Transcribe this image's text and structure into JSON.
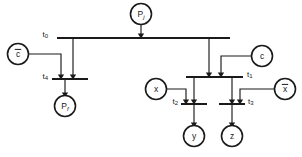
{
  "diagram": {
    "type": "petri-net",
    "title": "",
    "canvas": {
      "width": 302,
      "height": 157
    },
    "colors": {
      "ink": "#1a1a1a",
      "background": "#ffffff"
    },
    "places": [
      {
        "id": "Pj",
        "base": "P",
        "sub": "j",
        "overbar": false,
        "cx": 141,
        "cy": 14,
        "r": 10.5,
        "name": "place-pj"
      },
      {
        "id": "cbar",
        "base": "c",
        "sub": "",
        "overbar": true,
        "cx": 18,
        "cy": 54,
        "r": 10.5,
        "name": "place-c-bar"
      },
      {
        "id": "Pf",
        "base": "P",
        "sub": "f",
        "overbar": false,
        "cx": 65,
        "cy": 106,
        "r": 10.5,
        "name": "place-pf"
      },
      {
        "id": "c",
        "base": "c",
        "sub": "",
        "overbar": false,
        "cx": 262,
        "cy": 56,
        "r": 10.5,
        "name": "place-c"
      },
      {
        "id": "x",
        "base": "x",
        "sub": "",
        "overbar": false,
        "cx": 156,
        "cy": 89,
        "r": 10.5,
        "name": "place-x"
      },
      {
        "id": "xbar",
        "base": "x",
        "sub": "",
        "overbar": true,
        "cx": 285,
        "cy": 89,
        "r": 10.5,
        "name": "place-x-bar"
      },
      {
        "id": "y",
        "base": "y",
        "sub": "",
        "overbar": false,
        "cx": 194,
        "cy": 136,
        "r": 10.5,
        "name": "place-y"
      },
      {
        "id": "z",
        "base": "z",
        "sub": "",
        "overbar": false,
        "cx": 232,
        "cy": 136,
        "r": 10.5,
        "name": "place-z"
      }
    ],
    "transitions": [
      {
        "id": "t0",
        "base": "t",
        "sub": "0",
        "x1": 57,
        "x2": 230,
        "y": 38,
        "label_x": 48,
        "label_y": 34,
        "label_anchor": "end",
        "name": "transition-t0"
      },
      {
        "id": "t4",
        "base": "t",
        "sub": "4",
        "x1": 52,
        "x2": 88,
        "y": 79,
        "label_x": 48,
        "label_y": 76,
        "label_anchor": "end",
        "name": "transition-t4"
      },
      {
        "id": "t1",
        "base": "t",
        "sub": "1",
        "x1": 186,
        "x2": 243,
        "y": 77,
        "label_x": 247,
        "label_y": 74,
        "label_anchor": "start",
        "name": "transition-t1"
      },
      {
        "id": "t2",
        "base": "t",
        "sub": "2",
        "x1": 181,
        "x2": 207,
        "y": 104,
        "label_x": 178,
        "label_y": 101,
        "label_anchor": "end",
        "name": "transition-t2"
      },
      {
        "id": "t3",
        "base": "t",
        "sub": "3",
        "x1": 219,
        "x2": 245,
        "y": 104,
        "label_x": 248,
        "label_y": 101,
        "label_anchor": "start",
        "name": "transition-t3"
      }
    ],
    "arcs": [
      {
        "id": "pj-t0",
        "from": "Pj",
        "to": "t0",
        "points": "141,24.5 141,36",
        "arrow": true,
        "name": "arc-pj-to-t0"
      },
      {
        "id": "t0-t4",
        "from": "t0",
        "to": "t4",
        "points": "73,39 73,77",
        "arrow": true,
        "name": "arc-t0-to-t4"
      },
      {
        "id": "t0-t1",
        "from": "t0",
        "to": "t1",
        "points": "209,39 209,75",
        "arrow": true,
        "name": "arc-t0-to-t1"
      },
      {
        "id": "cbar-t4",
        "from": "cbar",
        "to": "t4",
        "points": "28.5,54 61,54 61,77",
        "arrow": true,
        "name": "arc-cbar-to-t4"
      },
      {
        "id": "t4-pf",
        "from": "t4",
        "to": "Pf",
        "points": "65,80 65,95",
        "arrow": true,
        "name": "arc-t4-to-pf"
      },
      {
        "id": "c-t1",
        "from": "c",
        "to": "t1",
        "points": "251.5,56 221,56 221,75",
        "arrow": true,
        "name": "arc-c-to-t1"
      },
      {
        "id": "t1-t2",
        "from": "t1",
        "to": "t2",
        "points": "194,78 194,102",
        "arrow": true,
        "name": "arc-t1-to-t2"
      },
      {
        "id": "t1-t3",
        "from": "t1",
        "to": "t3",
        "points": "232,78 232,102",
        "arrow": true,
        "name": "arc-t1-to-t3"
      },
      {
        "id": "x-t2",
        "from": "x",
        "to": "t2",
        "points": "166.5,89 186,89 186,102",
        "arrow": true,
        "name": "arc-x-to-t2"
      },
      {
        "id": "xbar-t3",
        "from": "xbar",
        "to": "t3",
        "points": "274.5,89 240,89 240,102",
        "arrow": true,
        "name": "arc-xbar-to-t3"
      },
      {
        "id": "t2-y",
        "from": "t2",
        "to": "y",
        "points": "194,105 194,125",
        "arrow": true,
        "name": "arc-t2-to-y"
      },
      {
        "id": "t3-z",
        "from": "t3",
        "to": "z",
        "points": "232,105 232,125",
        "arrow": true,
        "name": "arc-t3-to-z"
      }
    ]
  }
}
